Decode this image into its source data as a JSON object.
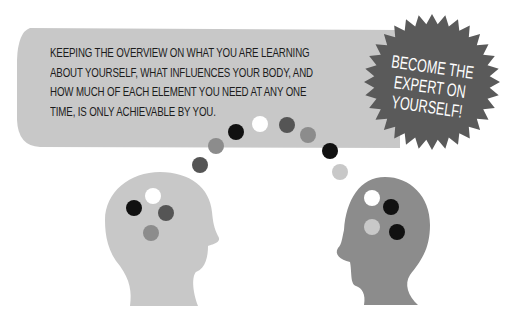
{
  "speech_bubble": {
    "lines": [
      "KEEPING THE OVERVIEW ON WHAT YOU ARE LEARNING",
      "ABOUT YOURSELF, WHAT INFLUENCES YOUR BODY, AND",
      "HOW MUCH OF EACH ELEMENT YOU NEED AT ANY ONE",
      "TIME, IS ONLY ACHIEVABLE BY YOU."
    ],
    "fill_color": "#c8c8c8"
  },
  "starburst": {
    "lines": [
      "BECOME THE",
      "EXPERT ON",
      "YOURSELF!"
    ],
    "fill_color": "#5a5a5a",
    "text_color": "#ffffff"
  },
  "thought_dots": [
    {
      "cx": 200,
      "cy": 165,
      "r": 8,
      "color": "#555555"
    },
    {
      "cx": 216,
      "cy": 146,
      "r": 8,
      "color": "#8c8c8c"
    },
    {
      "cx": 236,
      "cy": 132,
      "r": 8,
      "color": "#111111"
    },
    {
      "cx": 260,
      "cy": 124,
      "r": 8,
      "color": "#ffffff"
    },
    {
      "cx": 287,
      "cy": 125,
      "r": 8,
      "color": "#555555"
    },
    {
      "cx": 308,
      "cy": 135,
      "r": 8,
      "color": "#8c8c8c"
    },
    {
      "cx": 330,
      "cy": 151,
      "r": 8,
      "color": "#111111"
    },
    {
      "cx": 340,
      "cy": 172,
      "r": 8,
      "color": "#c8c8c8"
    }
  ],
  "left_head": {
    "fill_color": "#c8c8c8",
    "dots": [
      {
        "cx": 153,
        "cy": 196,
        "r": 8,
        "color": "#ffffff"
      },
      {
        "cx": 134,
        "cy": 208,
        "r": 8,
        "color": "#111111"
      },
      {
        "cx": 166,
        "cy": 213,
        "r": 8,
        "color": "#555555"
      },
      {
        "cx": 151,
        "cy": 233,
        "r": 8,
        "color": "#8c8c8c"
      }
    ]
  },
  "right_head": {
    "fill_color": "#8c8c8c",
    "dots": [
      {
        "cx": 372,
        "cy": 198,
        "r": 8,
        "color": "#ffffff"
      },
      {
        "cx": 391,
        "cy": 207,
        "r": 8,
        "color": "#111111"
      },
      {
        "cx": 372,
        "cy": 227,
        "r": 8,
        "color": "#c8c8c8"
      },
      {
        "cx": 397,
        "cy": 232,
        "r": 8,
        "color": "#111111"
      }
    ]
  }
}
